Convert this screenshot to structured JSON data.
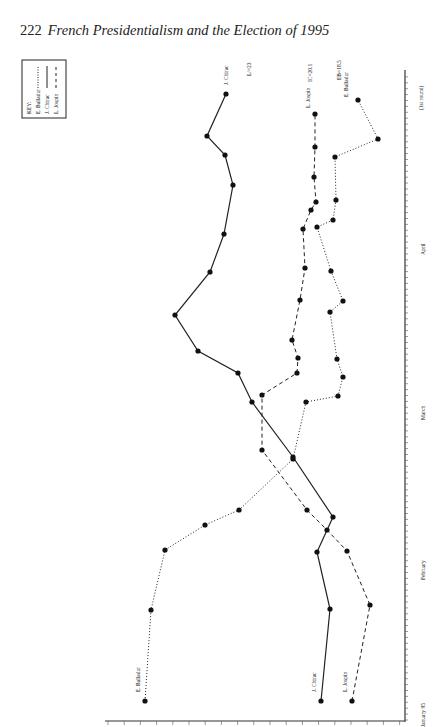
{
  "page": {
    "number": "222",
    "title": "French Presidentialism and the Election of 1995"
  },
  "legend": {
    "title": "KEY:",
    "entries": [
      {
        "name": "E. Balladur",
        "style": "dotted"
      },
      {
        "name": "J. Chirac",
        "style": "solid"
      },
      {
        "name": "L. Jospin",
        "style": "dashed"
      }
    ]
  },
  "annotations": {
    "chirac_end": "J. Chirac",
    "chirac_result": "L/=23",
    "jospin_end": "L. Jospin",
    "jospin_result": "IC=20.1",
    "balladur_end": "E. Balladur",
    "balladur_result": "EB=18.5",
    "balladur_start": "E. Balladur",
    "chirac_start": "J. Chirac",
    "jospin_start": "L. Jospin",
    "round_label": "(1st round)"
  },
  "chart_data": {
    "type": "line",
    "xlabel": "Date (January 95 – April 23, 1st round)",
    "ylabel": "Voting intention (%)",
    "month_labels": [
      "January 95",
      "February",
      "March",
      "April"
    ],
    "x_ticks_note": "Daily ticks: Jan 5–31, Feb 1–28, Mar 1–31, Apr 1–23",
    "categories": [
      "early Jan",
      "mid Jan",
      "late Jan",
      "early Feb",
      "mid Feb",
      "late Feb",
      "early Mar",
      "mid Mar",
      "late Mar",
      "early Apr",
      "mid Apr",
      "Apr 23 (1st round)"
    ],
    "series": [
      {
        "name": "J. Chirac",
        "style": "solid",
        "final": 23,
        "points_px": [
          [
            321,
            701
          ],
          [
            330,
            609
          ],
          [
            317,
            552
          ],
          [
            333,
            517
          ],
          [
            293,
            457
          ],
          [
            252,
            402
          ],
          [
            238,
            373
          ],
          [
            198,
            351
          ],
          [
            175,
            315
          ],
          [
            210,
            272
          ],
          [
            224,
            234
          ],
          [
            233,
            185
          ],
          [
            225,
            155
          ],
          [
            207,
            136
          ],
          [
            226,
            94
          ]
        ]
      },
      {
        "name": "L. Jospin",
        "style": "dashed",
        "final": 20.1,
        "points_px": [
          [
            352,
            701
          ],
          [
            370,
            605
          ],
          [
            347,
            551
          ],
          [
            327,
            530
          ],
          [
            307,
            510
          ],
          [
            262,
            450
          ],
          [
            262,
            395
          ],
          [
            297,
            373
          ],
          [
            298,
            358
          ],
          [
            292,
            340
          ],
          [
            300,
            300
          ],
          [
            305,
            268
          ],
          [
            303,
            229
          ],
          [
            311,
            210
          ],
          [
            316,
            202
          ],
          [
            314,
            177
          ],
          [
            315,
            147
          ],
          [
            315,
            114
          ]
        ]
      },
      {
        "name": "E. Balladur",
        "style": "dotted",
        "final": 18.5,
        "points_px": [
          [
            145,
            701
          ],
          [
            151,
            610
          ],
          [
            165,
            550
          ],
          [
            205,
            525
          ],
          [
            239,
            510
          ],
          [
            293,
            459
          ],
          [
            306,
            402
          ],
          [
            338,
            396
          ],
          [
            343,
            377
          ],
          [
            337,
            359
          ],
          [
            330,
            312
          ],
          [
            343,
            301
          ],
          [
            331,
            271
          ],
          [
            317,
            227
          ],
          [
            333,
            220
          ],
          [
            336,
            200
          ],
          [
            335,
            157
          ],
          [
            378,
            139
          ],
          [
            358,
            100
          ]
        ]
      }
    ],
    "grid": false,
    "legend_position": "top-left"
  }
}
